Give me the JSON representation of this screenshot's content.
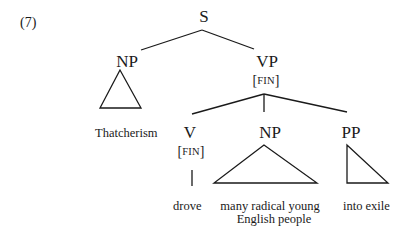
{
  "example_number": "(7)",
  "nodes": {
    "S": {
      "label": "S"
    },
    "NP_subject": {
      "label": "NP",
      "terminal": "Thatcherism"
    },
    "VP": {
      "label": "VP",
      "feature_open": "[",
      "feature": "FIN",
      "feature_close": "]"
    },
    "V": {
      "label": "V",
      "feature_open": "[",
      "feature": "FIN",
      "feature_close": "]",
      "terminal": "drove"
    },
    "NP_object": {
      "label": "NP",
      "terminal_line1": "many radical young",
      "terminal_line2": "English people"
    },
    "PP": {
      "label": "PP",
      "terminal": "into exile"
    }
  },
  "colors": {
    "ink": "#1a1a1a",
    "background": "#ffffff"
  }
}
